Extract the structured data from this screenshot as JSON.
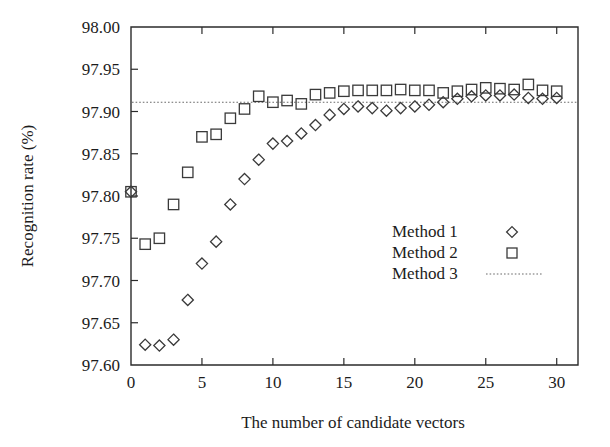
{
  "chart_data": {
    "type": "scatter",
    "title": "",
    "xlabel": "The number of candidate vectors",
    "ylabel": "Recognition rate (%)",
    "xlim": [
      0,
      31.5
    ],
    "ylim": [
      97.6,
      98.0
    ],
    "xticks": [
      0,
      5,
      10,
      15,
      20,
      25,
      30
    ],
    "xtick_labels": [
      "0",
      "5",
      "10",
      "15",
      "20",
      "25",
      "30"
    ],
    "yticks": [
      97.6,
      97.65,
      97.7,
      97.75,
      97.8,
      97.85,
      97.9,
      97.95,
      98.0
    ],
    "ytick_labels": [
      "97.60",
      "97.65",
      "97.70",
      "97.75",
      "97.80",
      "97.85",
      "97.90",
      "97.95",
      "98.00"
    ],
    "grid": false,
    "legend_position": "center-right",
    "series": [
      {
        "name": "Method 1",
        "marker": "diamond",
        "color": "#3a3a3a",
        "x": [
          0,
          1,
          2,
          3,
          4,
          5,
          6,
          7,
          8,
          9,
          10,
          11,
          12,
          13,
          14,
          15,
          16,
          17,
          18,
          19,
          20,
          21,
          22,
          23,
          24,
          25,
          26,
          27,
          28,
          29,
          30
        ],
        "values": [
          97.805,
          97.624,
          97.623,
          97.63,
          97.677,
          97.72,
          97.746,
          97.79,
          97.82,
          97.843,
          97.862,
          97.865,
          97.874,
          97.884,
          97.896,
          97.903,
          97.906,
          97.904,
          97.901,
          97.904,
          97.906,
          97.908,
          97.911,
          97.915,
          97.918,
          97.919,
          97.919,
          97.92,
          97.916,
          97.915,
          97.916
        ]
      },
      {
        "name": "Method 2",
        "marker": "square",
        "color": "#3a3a3a",
        "x": [
          0,
          1,
          2,
          3,
          4,
          5,
          6,
          7,
          8,
          9,
          10,
          11,
          12,
          13,
          14,
          15,
          16,
          17,
          18,
          19,
          20,
          21,
          22,
          23,
          24,
          25,
          26,
          27,
          28,
          29,
          30
        ],
        "values": [
          97.805,
          97.743,
          97.75,
          97.79,
          97.828,
          97.87,
          97.873,
          97.892,
          97.903,
          97.918,
          97.911,
          97.913,
          97.909,
          97.92,
          97.922,
          97.924,
          97.925,
          97.925,
          97.925,
          97.926,
          97.925,
          97.925,
          97.922,
          97.924,
          97.926,
          97.928,
          97.927,
          97.926,
          97.932,
          97.925,
          97.924
        ]
      },
      {
        "name": "Method 3",
        "marker": "dotted-line",
        "color": "#6a6a6a",
        "constant_value": 97.911
      }
    ],
    "legend_entries": [
      {
        "label": "Method 1",
        "marker": "diamond"
      },
      {
        "label": "Method 2",
        "marker": "square"
      },
      {
        "label": "Method 3",
        "marker": "dotted-line"
      }
    ]
  }
}
